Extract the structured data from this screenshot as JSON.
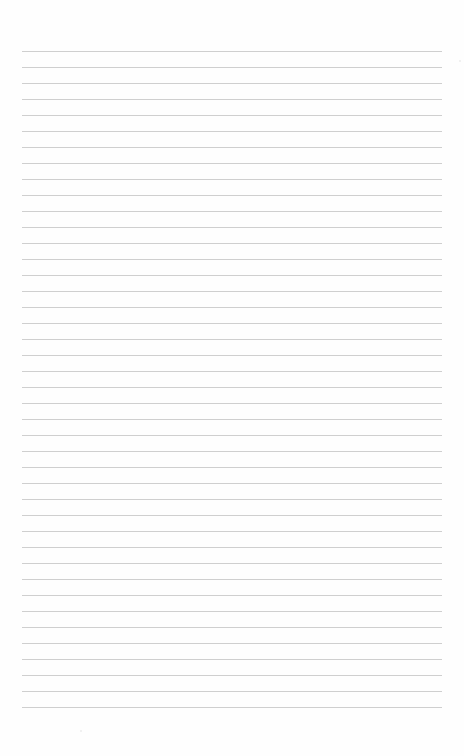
{
  "page": {
    "type": "ruled-paper",
    "background_color": "#fefefe",
    "content_text": ""
  },
  "rules": {
    "count": 42,
    "first_y": 51,
    "spacing": 16,
    "left_x": 22,
    "right_x": 442,
    "color": "#cfcfcf",
    "thickness": 1
  }
}
